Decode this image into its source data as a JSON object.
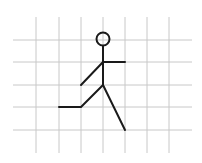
{
  "diagram": {
    "grid": {
      "color": "#c8c8c8",
      "vertical_x": [
        36,
        59,
        81,
        103,
        125,
        147,
        169
      ],
      "vertical_y_range": [
        17,
        153
      ],
      "horizontal_y": [
        40,
        62,
        85,
        107,
        130
      ],
      "horizontal_x_range": [
        13,
        192
      ]
    },
    "figure": {
      "color": "#1a1a1a",
      "stroke_width": 2,
      "head": {
        "cx": 103,
        "cy": 39,
        "r": 6.5
      },
      "segments": [
        {
          "name": "spine",
          "points": [
            [
              103,
              46
            ],
            [
              103,
              85
            ]
          ]
        },
        {
          "name": "right-arm",
          "points": [
            [
              103,
              62
            ],
            [
              125,
              62
            ]
          ]
        },
        {
          "name": "left-arm",
          "points": [
            [
              103,
              62
            ],
            [
              81,
              85
            ]
          ]
        },
        {
          "name": "left-leg",
          "points": [
            [
              103,
              85
            ],
            [
              81,
              107
            ],
            [
              59,
              107
            ]
          ]
        },
        {
          "name": "right-leg",
          "points": [
            [
              103,
              85
            ],
            [
              125,
              130
            ]
          ]
        }
      ]
    }
  }
}
